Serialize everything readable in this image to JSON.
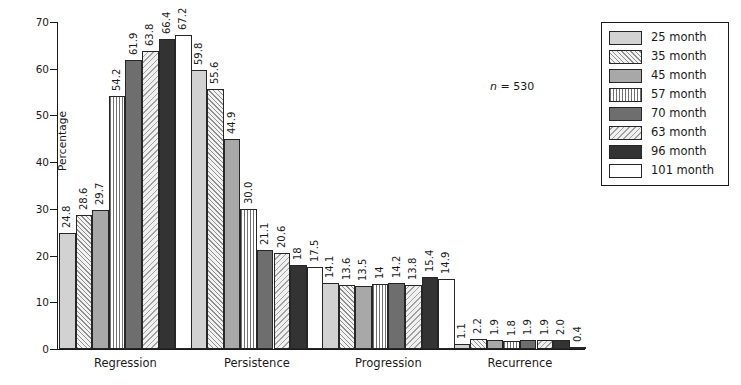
{
  "chart_data": {
    "type": "bar",
    "title": "",
    "xlabel": "",
    "ylabel": "Percentage",
    "ylim": [
      0,
      70
    ],
    "ytick_step": 10,
    "yticks": [
      0,
      10,
      20,
      30,
      40,
      50,
      60,
      70
    ],
    "grid": false,
    "legend_position": "top-right",
    "annotation": "n = 530",
    "annotation_italic_part": "n",
    "annotation_rest": " = 530",
    "categories": [
      "Regression",
      "Persistence",
      "Progression",
      "Recurrence"
    ],
    "series": [
      {
        "name": "25 month",
        "pattern": "solid-light-gray",
        "color": "#d2d2d2",
        "values": [
          24.8,
          59.8,
          14.1,
          1.1
        ],
        "labels": [
          "24.8",
          "59.8",
          "14.1",
          "1.1"
        ]
      },
      {
        "name": "35 month",
        "pattern": "diagonal-forward",
        "color": "#f2f2f2",
        "values": [
          28.6,
          55.6,
          13.6,
          2.2
        ],
        "labels": [
          "28.6",
          "55.6",
          "13.6",
          "2.2"
        ]
      },
      {
        "name": "45 month",
        "pattern": "solid-medium-gray",
        "color": "#a8a8a8",
        "values": [
          29.7,
          44.9,
          13.5,
          1.9
        ],
        "labels": [
          "29.7",
          "44.9",
          "13.5",
          "1.9"
        ]
      },
      {
        "name": "57 month",
        "pattern": "vertical-lines",
        "color": "#ffffff",
        "values": [
          54.2,
          30.0,
          14.0,
          1.8
        ],
        "labels": [
          "54.2",
          "30.0",
          "14",
          "1.8"
        ]
      },
      {
        "name": "70 month",
        "pattern": "solid-dark-gray",
        "color": "#6e6e6e",
        "values": [
          61.9,
          21.1,
          14.2,
          1.9
        ],
        "labels": [
          "61.9",
          "21.1",
          "14.2",
          "1.9"
        ]
      },
      {
        "name": "63 month",
        "pattern": "diagonal-backward",
        "color": "#f0f0f0",
        "values": [
          63.8,
          20.6,
          13.8,
          1.9
        ],
        "labels": [
          "63.8",
          "20.6",
          "13.8",
          "1.9"
        ]
      },
      {
        "name": "96 month",
        "pattern": "solid-very-dark",
        "color": "#333333",
        "values": [
          66.4,
          18.0,
          15.4,
          2.0
        ],
        "labels": [
          "66.4",
          "18",
          "15.4",
          "2.0"
        ]
      },
      {
        "name": "101 month",
        "pattern": "solid-white",
        "color": "#ffffff",
        "values": [
          67.2,
          17.5,
          14.9,
          0.4
        ],
        "labels": [
          "67.2",
          "17.5",
          "14.9",
          "0.4"
        ]
      }
    ]
  },
  "legend": {
    "items": [
      {
        "label": "25 month"
      },
      {
        "label": "35 month"
      },
      {
        "label": "45 month"
      },
      {
        "label": "57 month"
      },
      {
        "label": "70 month"
      },
      {
        "label": "63 month"
      },
      {
        "label": "96 month"
      },
      {
        "label": "101 month"
      }
    ]
  }
}
